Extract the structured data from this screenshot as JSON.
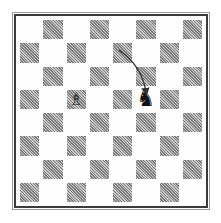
{
  "diagram": {
    "type": "chess-position",
    "board": {
      "files": [
        "a",
        "b",
        "c",
        "d",
        "e",
        "f",
        "g",
        "h"
      ],
      "ranks": [
        8,
        7,
        6,
        5,
        4,
        3,
        2,
        1
      ],
      "light_color": "#ffffff",
      "dark_color": "#9a9a9a",
      "orientation": "white-bottom"
    },
    "pieces": [
      {
        "square": "c5",
        "color": "white",
        "type": "bishop",
        "glyph": "♗"
      },
      {
        "square": "f5",
        "color": "black",
        "type": "knight",
        "glyph": "♞"
      }
    ],
    "arrows": [
      {
        "from": "e7",
        "to": "f5",
        "style": "curved",
        "color": "#333333"
      }
    ]
  }
}
